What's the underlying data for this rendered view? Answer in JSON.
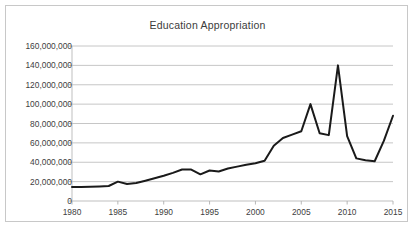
{
  "chart_data": {
    "type": "line",
    "title": "Education Appropriation",
    "xlabel": "",
    "ylabel": "",
    "xlim": [
      1980,
      2015
    ],
    "ylim": [
      0,
      160000000
    ],
    "grid": true,
    "legend": "none",
    "y_ticks": [
      0,
      20000000,
      40000000,
      60000000,
      80000000,
      100000000,
      120000000,
      140000000,
      160000000
    ],
    "y_tick_labels": [
      "0",
      "20,000,000",
      "40,000,000",
      "60,000,000",
      "80,000,000",
      "100,000,000",
      "120,000,000",
      "140,000,000",
      "160,000,000"
    ],
    "x_ticks": [
      1980,
      1985,
      1990,
      1995,
      2000,
      2005,
      2010,
      2015
    ],
    "x_tick_labels": [
      "1980",
      "1985",
      "1990",
      "1995",
      "2000",
      "2005",
      "2010",
      "2015"
    ],
    "series": [
      {
        "name": "Education Appropriation",
        "color": "#1a1a1a",
        "x": [
          1980,
          1981,
          1982,
          1983,
          1984,
          1985,
          1986,
          1987,
          1988,
          1989,
          1990,
          1991,
          1992,
          1993,
          1994,
          1995,
          1996,
          1997,
          1998,
          1999,
          2000,
          2001,
          2002,
          2003,
          2004,
          2005,
          2006,
          2007,
          2008,
          2009,
          2010,
          2011,
          2012,
          2013,
          2014,
          2015
        ],
        "values": [
          14500000,
          14500000,
          14700000,
          15000000,
          15500000,
          20000000,
          17500000,
          18500000,
          21000000,
          23500000,
          26000000,
          29000000,
          32500000,
          32500000,
          27500000,
          31500000,
          30500000,
          33500000,
          35500000,
          37500000,
          39000000,
          41500000,
          57000000,
          65000000,
          68500000,
          72000000,
          100000000,
          70000000,
          68000000,
          140000000,
          67000000,
          44000000,
          42000000,
          41000000,
          62000000,
          88000000
        ]
      }
    ]
  }
}
